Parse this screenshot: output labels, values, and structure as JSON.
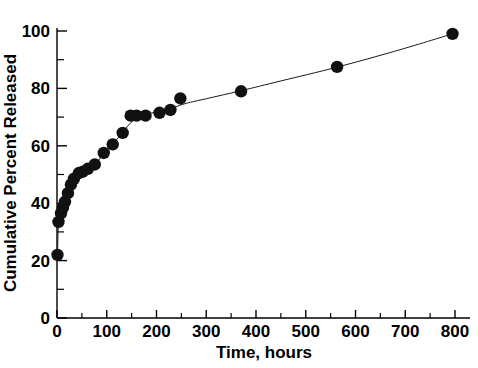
{
  "chart_data": {
    "type": "scatter",
    "title": "",
    "xlabel": "Time, hours",
    "ylabel": "Cumulative Percent Released",
    "xlim": [
      0,
      830
    ],
    "ylim": [
      0,
      108
    ],
    "xticks": [
      0,
      100,
      200,
      300,
      400,
      500,
      600,
      700,
      800
    ],
    "xtick_labels": [
      "0",
      "100",
      "200",
      "300",
      "400",
      "500",
      "600",
      "700",
      "800"
    ],
    "x_minor_step": 50,
    "yticks": [
      0,
      20,
      40,
      60,
      80,
      100
    ],
    "ytick_labels": [
      "0",
      "20",
      "40",
      "60",
      "80",
      "100"
    ],
    "y_minor_step": 10,
    "grid": false,
    "legend": null,
    "marker": "filled-circle",
    "marker_color": "#111111",
    "line_color": "#1a1a1a",
    "series": [
      {
        "name": "Cumulative release",
        "points": [
          [
            1,
            22.0
          ],
          [
            3,
            33.5
          ],
          [
            8,
            36.5
          ],
          [
            12,
            38.5
          ],
          [
            16,
            40.5
          ],
          [
            22,
            43.5
          ],
          [
            28,
            46.5
          ],
          [
            34,
            48.5
          ],
          [
            44,
            50.5
          ],
          [
            52,
            51.0
          ],
          [
            62,
            52.0
          ],
          [
            76,
            53.5
          ],
          [
            94,
            57.5
          ],
          [
            112,
            60.5
          ],
          [
            132,
            64.5
          ],
          [
            148,
            70.5
          ],
          [
            160,
            70.5
          ],
          [
            178,
            70.5
          ],
          [
            206,
            71.5
          ],
          [
            228,
            72.5
          ],
          [
            248,
            76.5
          ],
          [
            370,
            79.0
          ],
          [
            563,
            87.5
          ],
          [
            795,
            99.0
          ]
        ]
      }
    ],
    "fit_curve": [
      [
        1,
        22.0
      ],
      [
        3,
        33.0
      ],
      [
        8,
        36.6
      ],
      [
        14,
        39.4
      ],
      [
        22,
        43.0
      ],
      [
        30,
        46.6
      ],
      [
        40,
        49.4
      ],
      [
        52,
        51.2
      ],
      [
        65,
        52.4
      ],
      [
        80,
        54.2
      ],
      [
        95,
        57.6
      ],
      [
        112,
        60.6
      ],
      [
        130,
        64.2
      ],
      [
        148,
        68.0
      ],
      [
        165,
        70.0
      ],
      [
        185,
        71.2
      ],
      [
        210,
        72.2
      ],
      [
        235,
        73.4
      ],
      [
        260,
        74.8
      ],
      [
        300,
        76.4
      ],
      [
        370,
        79.2
      ],
      [
        450,
        82.6
      ],
      [
        563,
        87.4
      ],
      [
        680,
        93.0
      ],
      [
        795,
        99.0
      ]
    ]
  },
  "axes": {
    "x_title": "Time, hours",
    "y_title": "Cumulative Percent Released"
  }
}
